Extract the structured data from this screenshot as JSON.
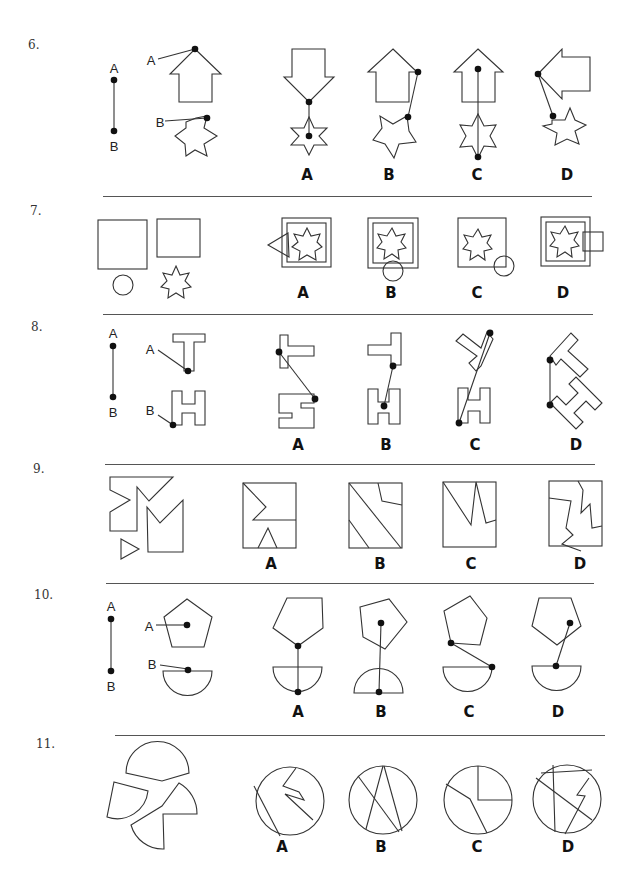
{
  "page": {
    "type": "spatial reasoning worksheet (assembling objects)",
    "background": "#ffffff",
    "line_color": "#555555"
  },
  "questions": [
    {
      "number": "6.",
      "type": "connection",
      "key_labels": [
        "A",
        "B"
      ],
      "given_shapes": [
        {
          "label": "A",
          "shape": "upward arrow",
          "point": "arrow tip"
        },
        {
          "label": "B",
          "shape": "six-point star",
          "point": "upper-right star point"
        }
      ],
      "options": [
        {
          "label": "A",
          "description": "downward arrow tip connected to star center"
        },
        {
          "label": "B",
          "description": "upward arrow right corner connected to five-point star"
        },
        {
          "label": "C",
          "description": "arrow center connected to bottom star point"
        },
        {
          "label": "D",
          "description": "left-pointing arrow tip connected to star point"
        }
      ]
    },
    {
      "number": "7.",
      "type": "assembly",
      "given_shapes": [
        "large square",
        "small square",
        "circle",
        "eight-point star"
      ],
      "options": [
        {
          "label": "A",
          "description": "double square with star and triangle on left"
        },
        {
          "label": "B",
          "description": "double square with star and circle at bottom"
        },
        {
          "label": "C",
          "description": "single square with star and circle at bottom-right corner"
        },
        {
          "label": "D",
          "description": "double square with star and small square on right"
        }
      ]
    },
    {
      "number": "8.",
      "type": "connection",
      "key_labels": [
        "A",
        "B"
      ],
      "given_shapes": [
        {
          "label": "A",
          "shape": "T shape",
          "point": "bottom of stem"
        },
        {
          "label": "B",
          "shape": "H shape",
          "point": "bottom-left corner"
        }
      ],
      "options": [
        {
          "label": "A"
        },
        {
          "label": "B"
        },
        {
          "label": "C"
        },
        {
          "label": "D"
        }
      ]
    },
    {
      "number": "9.",
      "type": "assembly",
      "given_shapes": [
        "notched polygon",
        "M-shaped polygon",
        "small triangle"
      ],
      "options": [
        {
          "label": "A"
        },
        {
          "label": "B"
        },
        {
          "label": "C"
        },
        {
          "label": "D"
        }
      ]
    },
    {
      "number": "10.",
      "type": "connection",
      "key_labels": [
        "A",
        "B"
      ],
      "given_shapes": [
        {
          "label": "A",
          "shape": "pentagon",
          "point": "center"
        },
        {
          "label": "B",
          "shape": "semicircle",
          "point": "center of flat edge"
        }
      ],
      "options": [
        {
          "label": "A"
        },
        {
          "label": "B"
        },
        {
          "label": "C"
        },
        {
          "label": "D"
        }
      ]
    },
    {
      "number": "11.",
      "type": "assembly",
      "given_shapes": [
        "circle segment",
        "circle sector",
        "notched circle piece"
      ],
      "options": [
        {
          "label": "A"
        },
        {
          "label": "B"
        },
        {
          "label": "C"
        },
        {
          "label": "D"
        }
      ]
    }
  ]
}
